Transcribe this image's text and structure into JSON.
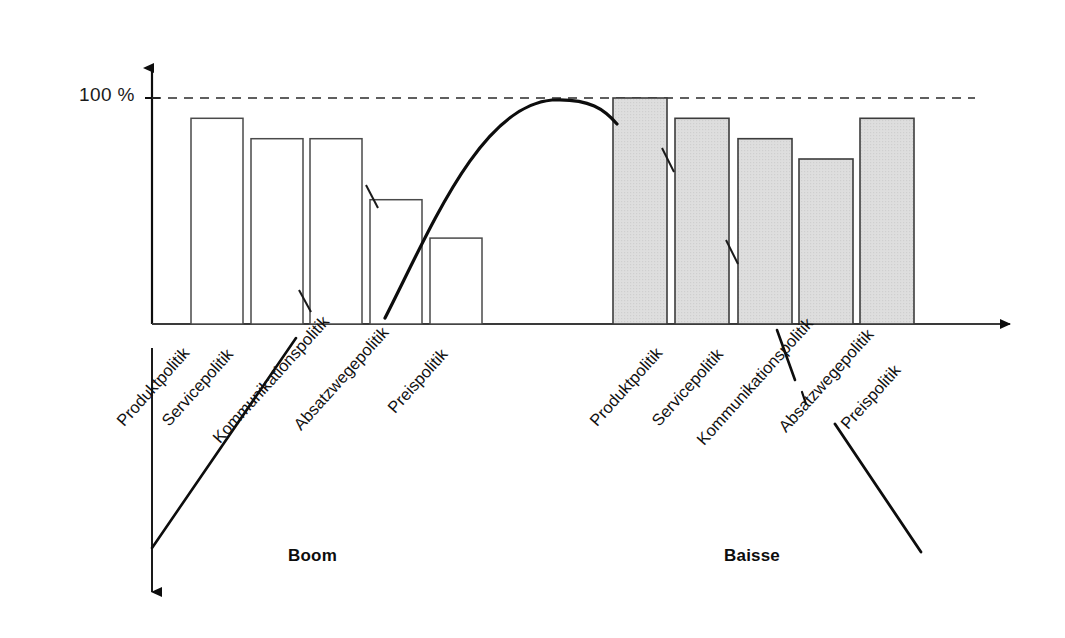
{
  "figure": {
    "background": "#ffffff",
    "frame_color": "#3a3a3a"
  },
  "axis": {
    "y_reference_label": "100 %",
    "reference_line_value": 100,
    "x_axis_arrow": "arrow-right",
    "y_axis_arrow": "arrow-up"
  },
  "captions": {
    "left": "Boom",
    "right": "Baisse"
  },
  "chart_data": {
    "type": "bar",
    "title": "",
    "subtitle": "",
    "xlabel": "",
    "ylabel": "100 %",
    "ylim": [
      0,
      115
    ],
    "grid": false,
    "legend_position": "none",
    "reference_lines": [
      {
        "value": 100,
        "label": "100 %",
        "style": "dashed"
      }
    ],
    "groups": [
      {
        "name": "Boom",
        "fill": "#ffffff",
        "stroke": "#4a4a4a",
        "categories": [
          "Produktpolitik",
          "Servicepolitik",
          "Kommunikationspolitik",
          "Absatzwegepolitik",
          "Preispolitik"
        ],
        "values": [
          91,
          82,
          82,
          55,
          38
        ]
      },
      {
        "name": "Baisse",
        "fill": "#dcdcdc",
        "stroke": "#3c3c3c",
        "categories": [
          "Produktpolitik",
          "Servicepolitik",
          "Kommunikationspolitik",
          "Absatzwegepolitik",
          "Preispolitik"
        ],
        "values": [
          100,
          91,
          82,
          73,
          91
        ]
      }
    ],
    "overlay_curve": {
      "description": "arc peaking at 100 % reference line between the two groups",
      "peak_value": 100
    }
  },
  "annotations": {
    "leader_lines": [
      "left-vertical-double-arrow",
      "left-diagonal-leader",
      "right-diagonal-leader",
      "right-absatzwege-leader"
    ]
  }
}
